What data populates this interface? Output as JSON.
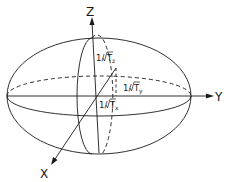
{
  "diagram": {
    "type": "ellipsoid",
    "axes": {
      "x": {
        "label": "X"
      },
      "y": {
        "label": "Y"
      },
      "z": {
        "label": "Z"
      }
    },
    "semi_axes": {
      "z": {
        "prefix": "1/",
        "symbol": "T",
        "subscript": "z"
      },
      "y": {
        "prefix": "1/",
        "symbol": "T",
        "subscript": "y"
      },
      "x": {
        "prefix": "1/",
        "symbol": "T",
        "subscript": "x"
      }
    },
    "colors": {
      "line": "#1a1a1a",
      "background": "#ffffff"
    }
  }
}
